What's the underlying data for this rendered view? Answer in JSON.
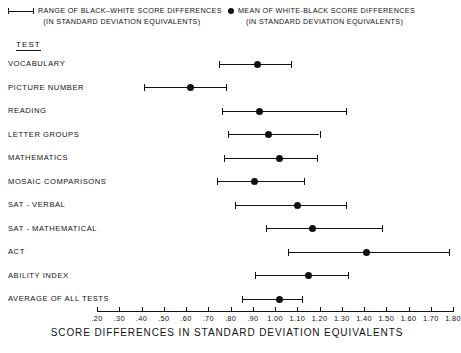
{
  "legend": {
    "range": {
      "glyph": "range-bar",
      "line1": "RANGE OF BLACK–WHITE SCORE DIFFERENCES",
      "line2": "(IN STANDARD DEVIATION EQUIVALENTS)"
    },
    "mean": {
      "glyph": "filled-dot",
      "line1": "MEAN OF WHITE-BLACK SCORE DIFFERENCES",
      "line2": "(IN STANDARD DEVIATION EQUIVALENTS)"
    }
  },
  "column_heading": "TEST",
  "axis": {
    "title": "SCORE DIFFERENCES IN STANDARD DEVIATION EQUIVALENTS",
    "ticks": [
      ".20",
      ".30",
      ".40",
      ".50",
      ".60",
      ".70",
      ".80",
      ".90",
      "1.00",
      "1.10",
      "1.20",
      "1.30",
      "1.40",
      "1.50",
      "1.60",
      "1.70",
      "1.80"
    ],
    "min": 0.2,
    "max": 1.8
  },
  "chart_data": {
    "type": "range-dot",
    "title": "SCORE DIFFERENCES IN STANDARD DEVIATION EQUIVALENTS",
    "xlabel": "SCORE DIFFERENCES IN STANDARD DEVIATION EQUIVALENTS",
    "ylabel": "TEST",
    "xlim": [
      0.2,
      1.8
    ],
    "grid": false,
    "legend_position": "top",
    "series": [
      {
        "name": "RANGE OF BLACK–WHITE SCORE DIFFERENCES",
        "marker": "range-bar"
      },
      {
        "name": "MEAN OF WHITE-BLACK SCORE DIFFERENCES",
        "marker": "filled-dot"
      }
    ],
    "categories": [
      "VOCABULARY",
      "PICTURE NUMBER",
      "READING",
      "LETTER GROUPS",
      "MATHEMATICS",
      "MOSAIC COMPARISONS",
      "SAT - VERBAL",
      "SAT - MATHEMATICAL",
      "ACT",
      "ABILITY INDEX",
      "AVERAGE OF ALL TESTS"
    ],
    "rows": [
      {
        "label": "VOCABULARY",
        "low": 0.75,
        "mean": 0.92,
        "high": 1.07
      },
      {
        "label": "PICTURE NUMBER",
        "low": 0.41,
        "mean": 0.62,
        "high": 0.78
      },
      {
        "label": "READING",
        "low": 0.76,
        "mean": 0.93,
        "high": 1.32
      },
      {
        "label": "LETTER GROUPS",
        "low": 0.79,
        "mean": 0.97,
        "high": 1.2
      },
      {
        "label": "MATHEMATICS",
        "low": 0.77,
        "mean": 1.02,
        "high": 1.19
      },
      {
        "label": "MOSAIC COMPARISONS",
        "low": 0.74,
        "mean": 0.91,
        "high": 1.13
      },
      {
        "label": "SAT - VERBAL",
        "low": 0.82,
        "mean": 1.1,
        "high": 1.32
      },
      {
        "label": "SAT - MATHEMATICAL",
        "low": 0.96,
        "mean": 1.17,
        "high": 1.48
      },
      {
        "label": "ACT",
        "low": 1.06,
        "mean": 1.41,
        "high": 1.78
      },
      {
        "label": "ABILITY INDEX",
        "low": 0.91,
        "mean": 1.15,
        "high": 1.33
      },
      {
        "label": "AVERAGE OF ALL TESTS",
        "low": 0.85,
        "mean": 1.02,
        "high": 1.12
      }
    ]
  }
}
